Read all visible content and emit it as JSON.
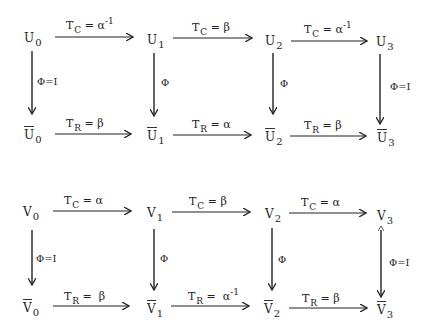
{
  "diagrams": [
    {
      "name": "U-diagram",
      "top_nodes": [
        {
          "base": "U",
          "sub": "0"
        },
        {
          "base": "U",
          "sub": "1"
        },
        {
          "base": "U",
          "sub": "2"
        },
        {
          "base": "U",
          "sub": "3"
        }
      ],
      "bottom_nodes": [
        {
          "base": "U",
          "sub": "0",
          "bar": true
        },
        {
          "base": "U",
          "sub": "1",
          "bar": true
        },
        {
          "base": "U",
          "sub": "2",
          "bar": true
        },
        {
          "base": "U",
          "sub": "3",
          "bar": true
        }
      ],
      "top_arrows": [
        {
          "T": "T",
          "sub": "C",
          "eq": " = ",
          "val": "α",
          "sup": "-1"
        },
        {
          "T": "T",
          "sub": "C",
          "eq": " = ",
          "val": "β",
          "sup": ""
        },
        {
          "T": "T",
          "sub": "C",
          "eq": " = ",
          "val": "α",
          "sup": "-1"
        }
      ],
      "bottom_arrows": [
        {
          "T": "T",
          "sub": "R",
          "eq": " = ",
          "val": "β",
          "sup": ""
        },
        {
          "T": "T",
          "sub": "R",
          "eq": " = ",
          "val": "α",
          "sup": ""
        },
        {
          "T": "T",
          "sub": "R",
          "eq": " = ",
          "val": "β",
          "sup": ""
        }
      ],
      "vertical_labels": [
        "Φ=I",
        "Φ",
        "Φ",
        "Φ=I"
      ]
    },
    {
      "name": "V-diagram",
      "top_nodes": [
        {
          "base": "V",
          "sub": "0"
        },
        {
          "base": "V",
          "sub": "1"
        },
        {
          "base": "V",
          "sub": "2"
        },
        {
          "base": "V",
          "sub": "3"
        }
      ],
      "bottom_nodes": [
        {
          "base": "V",
          "sub": "0",
          "bar": true
        },
        {
          "base": "V",
          "sub": "1",
          "bar": true
        },
        {
          "base": "V",
          "sub": "2",
          "bar": true
        },
        {
          "base": "V",
          "sub": "3",
          "bar": true
        }
      ],
      "top_arrows": [
        {
          "T": "T",
          "sub": "C",
          "eq": " = ",
          "val": "α",
          "sup": ""
        },
        {
          "T": "T",
          "sub": "C",
          "eq": " = ",
          "val": "β",
          "sup": ""
        },
        {
          "T": "T",
          "sub": "C",
          "eq": " = ",
          "val": "α",
          "sup": ""
        }
      ],
      "bottom_arrows": [
        {
          "T": "T",
          "sub": "R",
          "eq": " =  ",
          "val": "β",
          "sup": ""
        },
        {
          "T": "T",
          "sub": "R",
          "eq": " =  ",
          "val": "α",
          "sup": "-1"
        },
        {
          "T": "T",
          "sub": "R",
          "eq": " = ",
          "val": "β",
          "sup": ""
        }
      ],
      "vertical_labels": [
        "Φ=I",
        "Φ",
        "Φ",
        "Φ=I"
      ]
    }
  ]
}
